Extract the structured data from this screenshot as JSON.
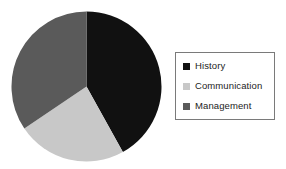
{
  "chart_data": {
    "type": "pie",
    "title": "",
    "categories": [
      "History",
      "Communication",
      "Management"
    ],
    "values": [
      42,
      24,
      34
    ],
    "units": "percent",
    "colors": [
      "#111111",
      "#c8c8c8",
      "#5a5a5a"
    ],
    "start_angle_deg": 0,
    "direction": "clockwise",
    "slices": [
      {
        "label": "History",
        "value": 42,
        "color": "#111111",
        "start_deg": 0,
        "end_deg": 151
      },
      {
        "label": "Communication",
        "value": 24,
        "color": "#c8c8c8",
        "start_deg": 151,
        "end_deg": 236
      },
      {
        "label": "Management",
        "value": 34,
        "color": "#5a5a5a",
        "start_deg": 236,
        "end_deg": 360
      }
    ],
    "legend": {
      "position": "right",
      "border_color": "#7a7a7a",
      "entries": [
        {
          "label": "History",
          "color": "#111111"
        },
        {
          "label": "Communication",
          "color": "#c8c8c8"
        },
        {
          "label": "Management",
          "color": "#5a5a5a"
        }
      ]
    },
    "geometry": {
      "center_x": 75.5,
      "center_y": 75.5,
      "radius": 75
    },
    "background": "#ffffff",
    "grid": false,
    "xlabel": "",
    "ylabel": ""
  }
}
